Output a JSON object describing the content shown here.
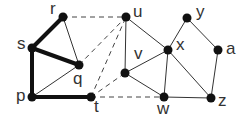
{
  "graph": {
    "nodes": [
      {
        "id": "r",
        "label": "r",
        "x": 63,
        "y": 17,
        "lx": 50,
        "ly": 0
      },
      {
        "id": "s",
        "label": "s",
        "x": 32,
        "y": 48,
        "lx": 17,
        "ly": 35
      },
      {
        "id": "q",
        "label": "q",
        "x": 79,
        "y": 65,
        "lx": 73,
        "ly": 70
      },
      {
        "id": "p",
        "label": "p",
        "x": 32,
        "y": 97,
        "lx": 16,
        "ly": 87
      },
      {
        "id": "t",
        "label": "t",
        "x": 91,
        "y": 97,
        "lx": 94,
        "ly": 98
      },
      {
        "id": "u",
        "label": "u",
        "x": 126,
        "y": 17,
        "lx": 133,
        "ly": 3
      },
      {
        "id": "v",
        "label": "v",
        "x": 125,
        "y": 73,
        "lx": 134,
        "ly": 45
      },
      {
        "id": "x",
        "label": "x",
        "x": 168,
        "y": 50,
        "lx": 176,
        "ly": 36
      },
      {
        "id": "w",
        "label": "w",
        "x": 164,
        "y": 97,
        "lx": 157,
        "ly": 100
      },
      {
        "id": "y",
        "label": "y",
        "x": 187,
        "y": 18,
        "lx": 196,
        "ly": 3
      },
      {
        "id": "a",
        "label": "a",
        "x": 218,
        "y": 50,
        "lx": 226,
        "ly": 40
      },
      {
        "id": "z",
        "label": "z",
        "x": 211,
        "y": 98,
        "lx": 218,
        "ly": 92
      }
    ],
    "edges": [
      {
        "from": "r",
        "to": "s",
        "style": "thick"
      },
      {
        "from": "s",
        "to": "q",
        "style": "thick"
      },
      {
        "from": "s",
        "to": "p",
        "style": "thick"
      },
      {
        "from": "p",
        "to": "t",
        "style": "thick"
      },
      {
        "from": "r",
        "to": "q",
        "style": "thin"
      },
      {
        "from": "p",
        "to": "q",
        "style": "thin"
      },
      {
        "from": "u",
        "to": "v",
        "style": "thin"
      },
      {
        "from": "u",
        "to": "x",
        "style": "thin"
      },
      {
        "from": "v",
        "to": "x",
        "style": "thin"
      },
      {
        "from": "v",
        "to": "w",
        "style": "thin"
      },
      {
        "from": "x",
        "to": "w",
        "style": "thin"
      },
      {
        "from": "x",
        "to": "z",
        "style": "thin"
      },
      {
        "from": "w",
        "to": "z",
        "style": "thin"
      },
      {
        "from": "x",
        "to": "y",
        "style": "thin"
      },
      {
        "from": "y",
        "to": "a",
        "style": "thin"
      },
      {
        "from": "a",
        "to": "z",
        "style": "thin"
      },
      {
        "from": "r",
        "to": "u",
        "style": "dashed"
      },
      {
        "from": "q",
        "to": "u",
        "style": "dashed"
      },
      {
        "from": "t",
        "to": "u",
        "style": "dashed"
      },
      {
        "from": "t",
        "to": "v",
        "style": "dashed"
      },
      {
        "from": "t",
        "to": "w",
        "style": "dashed"
      }
    ],
    "colors": {
      "node": "#111111",
      "edge": "#222222",
      "label": "#333333"
    }
  }
}
